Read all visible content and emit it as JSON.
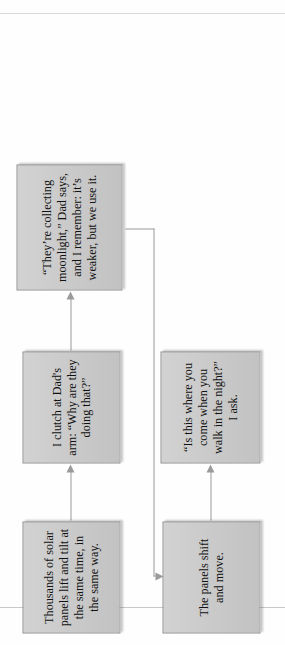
{
  "document": {
    "type": "flowchart",
    "orientation": "rotated-90-ccw",
    "title": "Solar panel night-walk flowchart"
  },
  "flowchart": {
    "node_fill_color": "#c9c9c9",
    "node_border_color": "#8e8e8e",
    "connector_color": "#9a9a9a",
    "page_background": "#fefefe",
    "nodes": [
      {
        "id": "solar-panels",
        "text": "Thousands of solar panels lift and tilt at the same time, in the same way."
      },
      {
        "id": "clutch-dad",
        "text": "I clutch at Dad's arm: “Why are they doing that?”"
      },
      {
        "id": "moonlight",
        "text": "“They’re collecting moonlight,” Dad says, and I remember: it’s weaker, but we use it."
      },
      {
        "id": "panels-shift",
        "text": "The panels shift and move."
      },
      {
        "id": "night-walk",
        "text": "“Is this where you come when you walk in the night?” I ask."
      }
    ],
    "connectors": [
      {
        "id": "a",
        "from": "solar-panels",
        "to": "clutch-dad",
        "style": "straight-arrow"
      },
      {
        "id": "b",
        "from": "clutch-dad",
        "to": "moonlight",
        "style": "straight-arrow"
      },
      {
        "id": "d",
        "from": "moonlight",
        "to": "panels-shift",
        "style": "elbow-arrow"
      },
      {
        "id": "c",
        "from": "panels-shift",
        "to": "night-walk",
        "style": "straight-arrow"
      }
    ]
  }
}
